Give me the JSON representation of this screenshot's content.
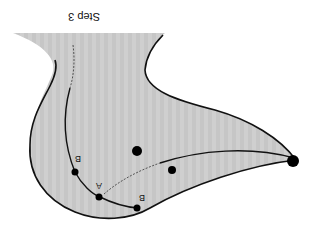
{
  "figure": {
    "orientation": "rotated-180",
    "title": "Step 3",
    "colors": {
      "region_fill": "#cfcfcf",
      "stroke": "#111111",
      "background": "#ffffff"
    },
    "points": [
      {
        "label": "B",
        "role": "upper-left-point"
      },
      {
        "label": "A",
        "role": "middle-point"
      },
      {
        "label": "B",
        "role": "lower-right-point"
      }
    ],
    "unlabeled_dots": 3
  }
}
